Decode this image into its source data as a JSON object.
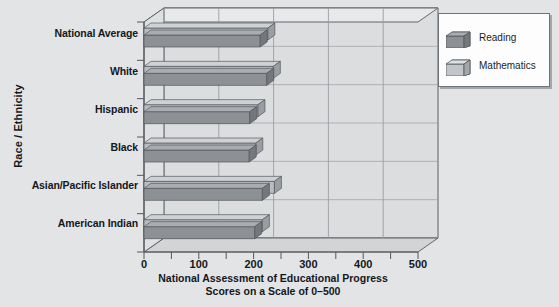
{
  "chart_data": {
    "type": "bar",
    "orientation": "horizontal",
    "style": "3d",
    "title": "",
    "xlabel": "National Assessment of Educational Progress Scores on a Scale of 0–500",
    "xlabel_line1": "National Assessment of Educational Progress",
    "xlabel_line2": "Scores on a Scale of 0–500",
    "ylabel": "Race / Ethnicity",
    "categories": [
      "National Average",
      "White",
      "Hispanic",
      "Black",
      "Asian/Pacific Islander",
      "American Indian"
    ],
    "series": [
      {
        "name": "Reading",
        "color": "#8d9094",
        "values": [
          212,
          224,
          193,
          192,
          216,
          202
        ]
      },
      {
        "name": "Mathematics",
        "color": "#b9bcc0",
        "values": [
          226,
          236,
          208,
          204,
          238,
          216
        ]
      }
    ],
    "xlim": [
      0,
      500
    ],
    "xticks": [
      0,
      100,
      200,
      300,
      400,
      500
    ],
    "xtick_labels": [
      "0",
      "100",
      "200",
      "300",
      "400",
      "500"
    ],
    "minor_tick_interval": 50,
    "grid": true,
    "grid_axis": "x",
    "legend_position": "right-top",
    "legend_entries": [
      "Reading",
      "Mathematics"
    ]
  },
  "colors": {
    "background": "#e3e4e6",
    "wall": "#dcdddf",
    "floor": "#d3d4d6",
    "gridline": "#9a9da1",
    "axis": "#55585c",
    "text": "#14181c",
    "reading_front": "#8d9094",
    "reading_top": "#a9acb0",
    "reading_side": "#74777b",
    "math_front": "#b9bcc0",
    "math_top": "#cfd2d5",
    "math_side": "#9a9da1",
    "legend_bg": "#fdfdfd",
    "legend_border": "#6f7478"
  },
  "legend": {
    "reading_label": "Reading",
    "mathematics_label": "Mathematics"
  },
  "axis": {
    "y_title": "Race / Ethnicity"
  }
}
